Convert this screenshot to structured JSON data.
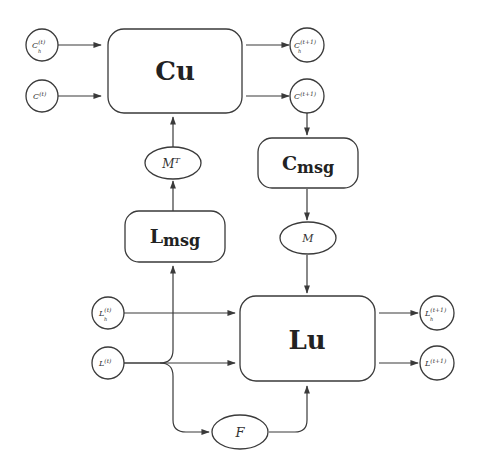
{
  "diagram": {
    "colors": {
      "stroke": "#3a3a3a",
      "text": "#222222",
      "background": "#ffffff"
    },
    "blocks": {
      "cu": {
        "label": "Cu"
      },
      "cmsg": {
        "label": "C",
        "sub": "msg"
      },
      "lmsg": {
        "label": "L",
        "sub": "msg"
      },
      "lu": {
        "label": "Lu"
      }
    },
    "nodes": {
      "c_h_t": {
        "base": "C",
        "sub": "h",
        "sup": "(t)"
      },
      "c_t": {
        "base": "C",
        "sup": "(t)"
      },
      "c_h_t1": {
        "base": "C",
        "sub": "h",
        "sup": "(t+1)"
      },
      "c_t1": {
        "base": "C",
        "sup": "(t+1)"
      },
      "l_h_t": {
        "base": "L",
        "sub": "h",
        "sup": "(t)"
      },
      "l_t": {
        "base": "L",
        "sup": "(t)"
      },
      "l_h_t1": {
        "base": "L",
        "sub": "h",
        "sup": "(t+1)"
      },
      "l_t1": {
        "base": "L",
        "sup": "(t+1)"
      },
      "mt": {
        "base": "M",
        "sup": "T"
      },
      "m": {
        "base": "M"
      },
      "f": {
        "base": "F"
      }
    },
    "edges": [
      {
        "from": "C_h^(t)",
        "to": "Cu"
      },
      {
        "from": "C^(t)",
        "to": "Cu"
      },
      {
        "from": "Cu",
        "to": "C_h^(t+1)"
      },
      {
        "from": "Cu",
        "to": "C^(t+1)"
      },
      {
        "from": "C^(t+1)",
        "to": "Cmsg"
      },
      {
        "from": "Cmsg",
        "to": "M"
      },
      {
        "from": "M",
        "to": "Lu"
      },
      {
        "from": "L^(t)",
        "to": "Lmsg"
      },
      {
        "from": "Lmsg",
        "to": "M^T"
      },
      {
        "from": "M^T",
        "to": "Cu"
      },
      {
        "from": "L_h^(t)",
        "to": "Lu"
      },
      {
        "from": "L^(t)",
        "to": "Lu"
      },
      {
        "from": "L^(t)",
        "to": "F"
      },
      {
        "from": "F",
        "to": "Lu"
      },
      {
        "from": "Lu",
        "to": "L_h^(t+1)"
      },
      {
        "from": "Lu",
        "to": "L^(t+1)"
      }
    ]
  }
}
